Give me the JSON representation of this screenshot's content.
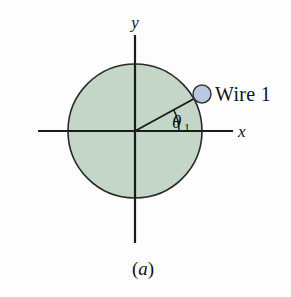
{
  "figure": {
    "caption": "(a)",
    "caption_paren_open": "(",
    "caption_letter": "a",
    "caption_paren_close": ")",
    "background_color": "#fdfdfd"
  },
  "axes": {
    "x_label": "x",
    "y_label": "y",
    "axis_color": "#1b1b1b",
    "origin": {
      "x": 135,
      "y": 131
    },
    "x_start": 38,
    "x_end": 233,
    "y_start": 35,
    "y_end": 243
  },
  "disk": {
    "name": "shaded-circle",
    "fill_color": "#c3d6c8",
    "stroke_color": "#2a2a2a",
    "center_x": 135,
    "center_y": 131,
    "radius": 67
  },
  "wire": {
    "label": "Wire 1",
    "marker_fill": "#b9c9e0",
    "marker_stroke": "#3a3a3a",
    "marker_x": 202,
    "marker_y": 94,
    "marker_radius": 9,
    "label_x": 215,
    "label_y": 100
  },
  "angle": {
    "symbol": "θ",
    "subscript": "1",
    "value_degrees": 29,
    "label_x": 176,
    "label_y": 127,
    "arc_radius": 44,
    "arc_color": "#1b1b1b",
    "radius_line_color": "#1b1b1b"
  }
}
